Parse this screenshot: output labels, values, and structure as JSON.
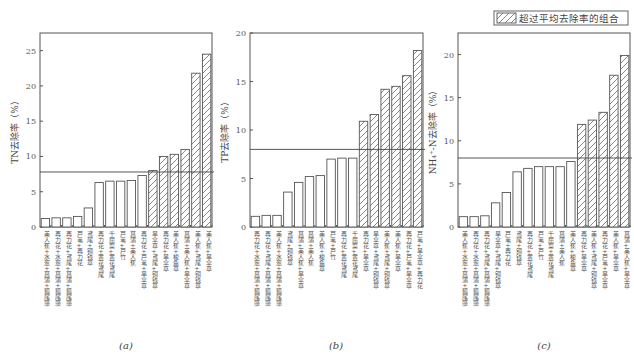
{
  "legend": {
    "label": "超过平均去除率的组合",
    "pattern": "hatched"
  },
  "chart_data": [
    {
      "type": "bar",
      "panel": "(a)",
      "ylabel": "TN去除率（%）",
      "ylim": [
        0,
        27.5
      ],
      "yticks": [
        0,
        5,
        10,
        15,
        20,
        25
      ],
      "mean": 7.8,
      "categories": [
        "美人蕉+水葱+菖蒲+狐尾藻",
        "再力花+水葱+菖蒲+狐尾藻",
        "再力花+鸢尾+菖蒲+狐尾藻",
        "芦苇+再力花",
        "鸢尾+铜钱草",
        "再力花+黄花鸢尾",
        "千屈菜+黄花鸢尾",
        "芦苇+芦竹",
        "菖蒲+美人蕉",
        "再力花+芦苇+旱伞草",
        "旱伞草+鸢尾+铜钱草",
        "再力花+旱伞草",
        "美人蕉+梭鱼草",
        "菖蒲+美人蕉+旱伞草",
        "美人蕉+鸢尾+铜钱草",
        "美人蕉+旱伞草"
      ],
      "values": [
        1.2,
        1.3,
        1.3,
        1.5,
        2.7,
        6.3,
        6.5,
        6.5,
        6.6,
        7.3,
        8.0,
        10.0,
        10.3,
        11.0,
        21.8,
        24.5
      ],
      "above_mean": [
        false,
        false,
        false,
        false,
        false,
        false,
        false,
        false,
        false,
        false,
        true,
        true,
        true,
        true,
        true,
        true
      ]
    },
    {
      "type": "bar",
      "panel": "(b)",
      "ylabel": "TP去除率（%）",
      "ylim": [
        0,
        20
      ],
      "yticks": [
        0,
        5,
        10,
        15,
        20
      ],
      "mean": 8.0,
      "categories": [
        "再力花+水葱+菖蒲+狐尾藻",
        "再力花+鸢尾+菖蒲+狐尾藻",
        "美人蕉+水葱+菖蒲+狐尾藻",
        "鸢尾+铜钱草",
        "菖蒲+美人蕉+旱伞草",
        "菖蒲+美人蕉",
        "美人蕉+梭鱼草",
        "芦苇+芦竹",
        "再力花+黄花鸢尾",
        "千屈菜+黄花鸢尾",
        "再力花+旱伞草",
        "旱伞草+鸢尾+铜钱草",
        "美人蕉+鸢尾+铜钱草",
        "美人蕉+旱伞草",
        "再力花+芦苇+旱伞草",
        "芦苇+旱伞草+再力花"
      ],
      "values": [
        1.1,
        1.2,
        1.2,
        3.6,
        4.6,
        5.2,
        5.3,
        7.0,
        7.1,
        7.1,
        10.9,
        11.6,
        14.2,
        14.5,
        15.6,
        18.2
      ],
      "above_mean": [
        false,
        false,
        false,
        false,
        false,
        false,
        false,
        false,
        false,
        false,
        true,
        true,
        true,
        true,
        true,
        true
      ]
    },
    {
      "type": "bar",
      "panel": "(c)",
      "ylabel": "NH₄⁺-N去除率（%）",
      "ylim": [
        0,
        22.5
      ],
      "yticks": [
        0,
        5,
        10,
        15,
        20
      ],
      "mean": 8.0,
      "categories": [
        "美人蕉+水葱+菖蒲+狐尾藻",
        "再力花+水葱+菖蒲+狐尾藻",
        "再力花+鸢尾+菖蒲+狐尾藻",
        "旱伞草+鸢尾+铜钱草",
        "芦苇+再力花",
        "鸢尾+铜钱草",
        "再力花+黄花鸢尾",
        "芦苇+芦竹",
        "千屈菜+黄花鸢尾",
        "菖蒲+美人蕉",
        "美人蕉+梭鱼草",
        "再力花+旱伞草",
        "美人蕉+鸢尾+铜钱草",
        "再力花+芦苇+旱伞草",
        "美人蕉+旱伞草",
        "菖蒲+美人蕉+旱伞草"
      ],
      "values": [
        1.2,
        1.2,
        1.3,
        2.8,
        4.0,
        6.4,
        6.8,
        7.0,
        7.0,
        7.0,
        7.6,
        11.9,
        12.4,
        13.3,
        17.6,
        19.9
      ],
      "above_mean": [
        false,
        false,
        false,
        false,
        false,
        false,
        false,
        false,
        false,
        false,
        false,
        true,
        true,
        true,
        true,
        true
      ]
    }
  ]
}
